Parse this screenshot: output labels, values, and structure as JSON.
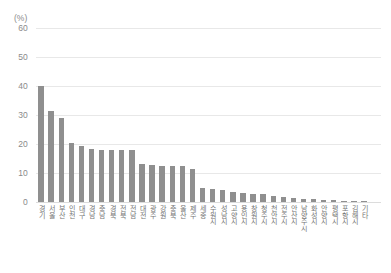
{
  "chart_data": {
    "type": "bar",
    "title": "",
    "subtitle": "",
    "xlabel": "",
    "ylabel": "",
    "unit_label": "(%)",
    "ylim": [
      0,
      60
    ],
    "ytick_labels": [
      "60",
      "50",
      "40",
      "30",
      "20",
      "10",
      "0"
    ],
    "yticks": [
      60,
      50,
      40,
      30,
      20,
      10,
      0
    ],
    "grid": true,
    "legend": "none",
    "bar_color": "#8f8f8f",
    "gridline_color": "#e8e8e8",
    "axis_text_color": "#8a8a8a",
    "categories": [
      "경기",
      "서울",
      "부산",
      "인천",
      "대구",
      "경남",
      "충남",
      "경북",
      "전북",
      "전남",
      "대전",
      "광주",
      "강원",
      "충북",
      "울산",
      "제주",
      "세종",
      "수원시",
      "성남시",
      "고양시",
      "용인시",
      "창원시",
      "청주시",
      "천안시",
      "전주시",
      "안산시",
      "남양주시",
      "화성시",
      "안양시",
      "평택시",
      "포항시",
      "김해시",
      "기타"
    ],
    "values": [
      40.0,
      31.5,
      29.0,
      20.5,
      19.3,
      18.2,
      18.0,
      18.0,
      18.0,
      17.8,
      13.0,
      12.6,
      12.5,
      12.5,
      12.4,
      11.5,
      5.0,
      4.5,
      4.0,
      3.6,
      3.2,
      2.9,
      2.6,
      2.2,
      1.9,
      1.5,
      1.2,
      1.0,
      0.8,
      0.6,
      0.5,
      0.4,
      0.3
    ]
  }
}
